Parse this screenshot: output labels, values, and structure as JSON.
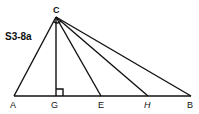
{
  "figure": {
    "label": "S3-8a",
    "points": {
      "C": {
        "label": "C",
        "x": 56,
        "y": 17
      },
      "A": {
        "label": "A",
        "x": 14,
        "y": 96
      },
      "G": {
        "label": "G",
        "x": 56,
        "y": 96
      },
      "E": {
        "label": "E",
        "x": 101,
        "y": 96
      },
      "H": {
        "label": "H",
        "x": 148,
        "y": 96
      },
      "B": {
        "label": "B",
        "x": 191,
        "y": 96
      }
    },
    "segments": [
      "AB",
      "CA",
      "CG",
      "CE",
      "CH",
      "CB"
    ],
    "right_angle_at": "G",
    "line_color": "#111111"
  }
}
